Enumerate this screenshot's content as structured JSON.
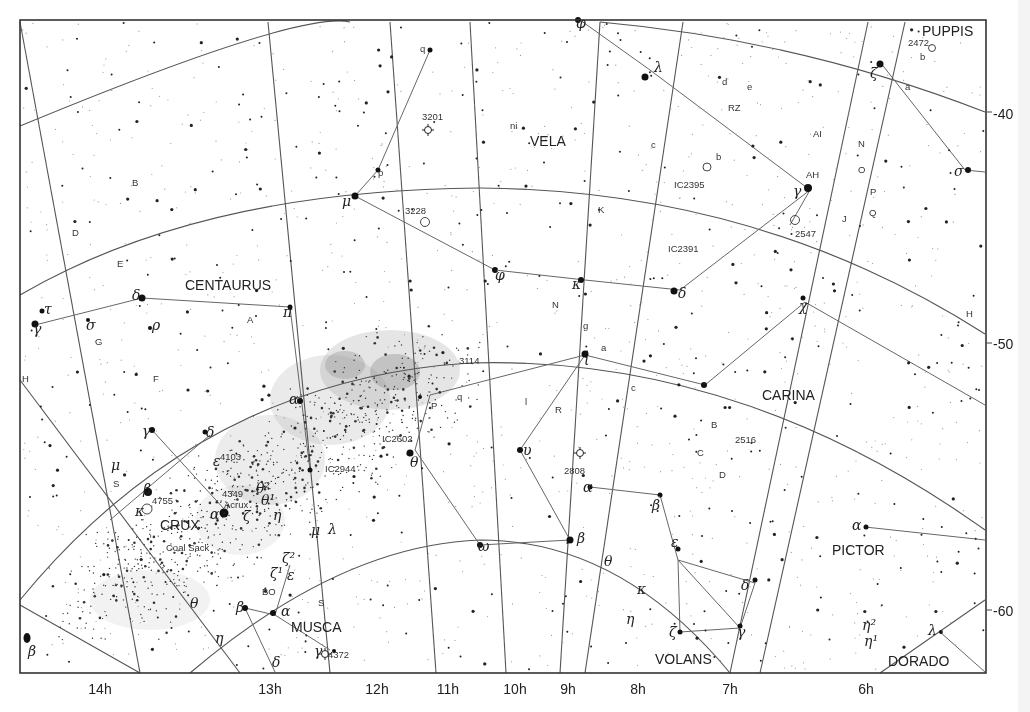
{
  "constellations": [
    {
      "name": "PUPPIS",
      "x": 922,
      "y": 36
    },
    {
      "name": "VELA",
      "x": 530,
      "y": 146
    },
    {
      "name": "CENTAURUS",
      "x": 185,
      "y": 290
    },
    {
      "name": "CARINA",
      "x": 762,
      "y": 400
    },
    {
      "name": "CRUX",
      "x": 160,
      "y": 530
    },
    {
      "name": "PICTOR",
      "x": 832,
      "y": 555
    },
    {
      "name": "MUSCA",
      "x": 291,
      "y": 632
    },
    {
      "name": "VOLANS",
      "x": 655,
      "y": 664
    },
    {
      "name": "DORADO",
      "x": 888,
      "y": 666
    }
  ],
  "ra_labels": [
    {
      "label": "14h",
      "x": 100
    },
    {
      "label": "13h",
      "x": 270
    },
    {
      "label": "12h",
      "x": 377
    },
    {
      "label": "11h",
      "x": 448
    },
    {
      "label": "10h",
      "x": 515
    },
    {
      "label": "9h",
      "x": 568
    },
    {
      "label": "8h",
      "x": 638
    },
    {
      "label": "7h",
      "x": 730
    },
    {
      "label": "6h",
      "x": 866
    }
  ],
  "dec_labels": [
    {
      "label": "-40",
      "y": 115
    },
    {
      "label": "-50",
      "y": 345
    },
    {
      "label": "-60",
      "y": 612
    }
  ],
  "deep_sky_objects": [
    {
      "label": "2472",
      "x": 908,
      "y": 46
    },
    {
      "label": "3201",
      "x": 422,
      "y": 120
    },
    {
      "label": "3228",
      "x": 405,
      "y": 214
    },
    {
      "label": "IC2395",
      "x": 674,
      "y": 188
    },
    {
      "label": "IC2391",
      "x": 668,
      "y": 252
    },
    {
      "label": "2547",
      "x": 795,
      "y": 237
    },
    {
      "label": "3114",
      "x": 459,
      "y": 364
    },
    {
      "label": "IC2602",
      "x": 382,
      "y": 442
    },
    {
      "label": "IC2944",
      "x": 325,
      "y": 472
    },
    {
      "label": "4103",
      "x": 220,
      "y": 460
    },
    {
      "label": "4349",
      "x": 222,
      "y": 497
    },
    {
      "label": "Acrux",
      "x": 224,
      "y": 508
    },
    {
      "label": "4755",
      "x": 152,
      "y": 504
    },
    {
      "label": "Coal Sack",
      "x": 166,
      "y": 551
    },
    {
      "label": "2808",
      "x": 564,
      "y": 474
    },
    {
      "label": "2516",
      "x": 735,
      "y": 443
    },
    {
      "label": "4372",
      "x": 328,
      "y": 658
    },
    {
      "label": "BO",
      "x": 262,
      "y": 595
    }
  ],
  "star_letters": [
    {
      "label": "q",
      "x": 420,
      "y": 52
    },
    {
      "label": "p",
      "x": 378,
      "y": 176
    },
    {
      "label": "B",
      "x": 132,
      "y": 186
    },
    {
      "label": "D",
      "x": 72,
      "y": 236
    },
    {
      "label": "E",
      "x": 117,
      "y": 267
    },
    {
      "label": "A",
      "x": 247,
      "y": 323
    },
    {
      "label": "G",
      "x": 95,
      "y": 345
    },
    {
      "label": "F",
      "x": 153,
      "y": 382
    },
    {
      "label": "H",
      "x": 22,
      "y": 382
    },
    {
      "label": "S",
      "x": 113,
      "y": 487
    },
    {
      "label": "ni",
      "x": 510,
      "y": 129
    },
    {
      "label": "d",
      "x": 722,
      "y": 85
    },
    {
      "label": "e",
      "x": 747,
      "y": 90
    },
    {
      "label": "RZ",
      "x": 728,
      "y": 111
    },
    {
      "label": "c",
      "x": 651,
      "y": 148
    },
    {
      "label": "b",
      "x": 716,
      "y": 160
    },
    {
      "label": "AI",
      "x": 813,
      "y": 137
    },
    {
      "label": "AH",
      "x": 806,
      "y": 178
    },
    {
      "label": "N",
      "x": 858,
      "y": 147
    },
    {
      "label": "O",
      "x": 858,
      "y": 173
    },
    {
      "label": "P",
      "x": 870,
      "y": 195
    },
    {
      "label": "Q",
      "x": 869,
      "y": 216
    },
    {
      "label": "J",
      "x": 842,
      "y": 222
    },
    {
      "label": "K",
      "x": 598,
      "y": 213
    },
    {
      "label": "N",
      "x": 552,
      "y": 308
    },
    {
      "label": "g",
      "x": 583,
      "y": 329
    },
    {
      "label": "a",
      "x": 601,
      "y": 351
    },
    {
      "label": "a",
      "x": 905,
      "y": 90
    },
    {
      "label": "b",
      "x": 920,
      "y": 60
    },
    {
      "label": "H",
      "x": 966,
      "y": 317
    },
    {
      "label": "B",
      "x": 711,
      "y": 428
    },
    {
      "label": "C",
      "x": 697,
      "y": 456
    },
    {
      "label": "D",
      "x": 719,
      "y": 478
    },
    {
      "label": "c",
      "x": 631,
      "y": 391
    },
    {
      "label": "l",
      "x": 525,
      "y": 405
    },
    {
      "label": "R",
      "x": 555,
      "y": 413
    },
    {
      "label": "P",
      "x": 431,
      "y": 409
    },
    {
      "label": "q",
      "x": 457,
      "y": 400
    },
    {
      "label": "S",
      "x": 318,
      "y": 606
    }
  ],
  "greek_labels": [
    {
      "label": "φ",
      "x": 576,
      "y": 28
    },
    {
      "label": "λ",
      "x": 654,
      "y": 72
    },
    {
      "label": "ζ",
      "x": 870,
      "y": 78
    },
    {
      "label": "σ",
      "x": 954,
      "y": 176
    },
    {
      "label": "γ",
      "x": 793,
      "y": 196
    },
    {
      "label": "μ",
      "x": 342,
      "y": 206
    },
    {
      "label": "φ",
      "x": 495,
      "y": 280
    },
    {
      "label": "κ",
      "x": 572,
      "y": 289
    },
    {
      "label": "δ",
      "x": 678,
      "y": 298
    },
    {
      "label": "χ",
      "x": 799,
      "y": 311
    },
    {
      "label": "δ",
      "x": 132,
      "y": 300
    },
    {
      "label": "τ",
      "x": 44,
      "y": 314
    },
    {
      "label": "γ",
      "x": 33,
      "y": 334
    },
    {
      "label": "σ",
      "x": 86,
      "y": 330
    },
    {
      "label": "ρ",
      "x": 152,
      "y": 330
    },
    {
      "label": "π",
      "x": 283,
      "y": 317
    },
    {
      "label": "α",
      "x": 289,
      "y": 404
    },
    {
      "label": "ι",
      "x": 584,
      "y": 365
    },
    {
      "label": "θ",
      "x": 410,
      "y": 467
    },
    {
      "label": "υ",
      "x": 523,
      "y": 455
    },
    {
      "label": "γ",
      "x": 142,
      "y": 436
    },
    {
      "label": "δ",
      "x": 206,
      "y": 437
    },
    {
      "label": "μ",
      "x": 111,
      "y": 470
    },
    {
      "label": "β",
      "x": 143,
      "y": 494
    },
    {
      "label": "κ",
      "x": 135,
      "y": 516
    },
    {
      "label": "ε",
      "x": 213,
      "y": 466
    },
    {
      "label": "θ²",
      "x": 256,
      "y": 493
    },
    {
      "label": "θ¹",
      "x": 261,
      "y": 505
    },
    {
      "label": "α",
      "x": 210,
      "y": 519
    },
    {
      "label": "ζ",
      "x": 243,
      "y": 521
    },
    {
      "label": "η",
      "x": 273,
      "y": 520
    },
    {
      "label": "μ",
      "x": 311,
      "y": 535
    },
    {
      "label": "λ",
      "x": 328,
      "y": 534
    },
    {
      "label": "ζ²",
      "x": 282,
      "y": 563
    },
    {
      "label": "ζ¹",
      "x": 270,
      "y": 578
    },
    {
      "label": "ε",
      "x": 287,
      "y": 580
    },
    {
      "label": "β",
      "x": 236,
      "y": 612
    },
    {
      "label": "α",
      "x": 281,
      "y": 616
    },
    {
      "label": "γ",
      "x": 314,
      "y": 656
    },
    {
      "label": "δ",
      "x": 272,
      "y": 667
    },
    {
      "label": "θ",
      "x": 190,
      "y": 608
    },
    {
      "label": "η",
      "x": 215,
      "y": 643
    },
    {
      "label": "β",
      "x": 28,
      "y": 656
    },
    {
      "label": "ω",
      "x": 478,
      "y": 551
    },
    {
      "label": "β",
      "x": 577,
      "y": 543
    },
    {
      "label": "α",
      "x": 583,
      "y": 492
    },
    {
      "label": "β",
      "x": 652,
      "y": 510
    },
    {
      "label": "ε",
      "x": 671,
      "y": 547
    },
    {
      "label": "θ",
      "x": 604,
      "y": 566
    },
    {
      "label": "κ",
      "x": 637,
      "y": 594
    },
    {
      "label": "δ",
      "x": 741,
      "y": 590
    },
    {
      "label": "η",
      "x": 626,
      "y": 624
    },
    {
      "label": "ζ",
      "x": 669,
      "y": 637
    },
    {
      "label": "γ",
      "x": 737,
      "y": 637
    },
    {
      "label": "α",
      "x": 852,
      "y": 530
    },
    {
      "label": "λ",
      "x": 928,
      "y": 635
    },
    {
      "label": "η²",
      "x": 862,
      "y": 630
    },
    {
      "label": "η¹",
      "x": 864,
      "y": 646
    }
  ],
  "chart_data": {
    "type": "star_chart",
    "title": "",
    "region": "Southern sky: Vela, Centaurus, Carina, Crux, Musca, Volans, Pictor, Puppis, Dorado",
    "ra_range": [
      "14h",
      "6h"
    ],
    "dec_range": [
      -35,
      -64
    ],
    "ra_ticks": [
      "14h",
      "13h",
      "12h",
      "11h",
      "10h",
      "9h",
      "8h",
      "7h",
      "6h"
    ],
    "dec_ticks": [
      -40,
      -50,
      -60
    ],
    "grid": true
  }
}
